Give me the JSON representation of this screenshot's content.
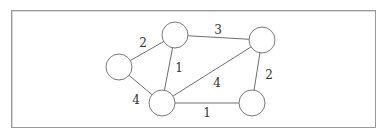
{
  "diagram": {
    "type": "weighted-undirected-graph",
    "node_radius": 13,
    "colors": {
      "edge": "#6e6e6e",
      "node_stroke": "#7a7a7a",
      "label": "#333333",
      "frame": "#9a9a9a"
    },
    "nodes": [
      {
        "id": "A",
        "x": 119,
        "y": 67
      },
      {
        "id": "B",
        "x": 175,
        "y": 35
      },
      {
        "id": "C",
        "x": 262,
        "y": 40
      },
      {
        "id": "D",
        "x": 162,
        "y": 103
      },
      {
        "id": "E",
        "x": 252,
        "y": 103
      }
    ],
    "edges": [
      {
        "from": "A",
        "to": "B",
        "weight": "2",
        "label_x": 143,
        "label_y": 47
      },
      {
        "from": "B",
        "to": "C",
        "weight": "3",
        "label_x": 218,
        "label_y": 34
      },
      {
        "from": "B",
        "to": "D",
        "weight": "1",
        "label_x": 179,
        "label_y": 72
      },
      {
        "from": "A",
        "to": "D",
        "weight": "4",
        "label_x": 136,
        "label_y": 104
      },
      {
        "from": "D",
        "to": "C",
        "weight": "4",
        "label_x": 217,
        "label_y": 87
      },
      {
        "from": "C",
        "to": "E",
        "weight": "2",
        "label_x": 269,
        "label_y": 79
      },
      {
        "from": "D",
        "to": "E",
        "weight": "1",
        "label_x": 207,
        "label_y": 117
      }
    ]
  }
}
